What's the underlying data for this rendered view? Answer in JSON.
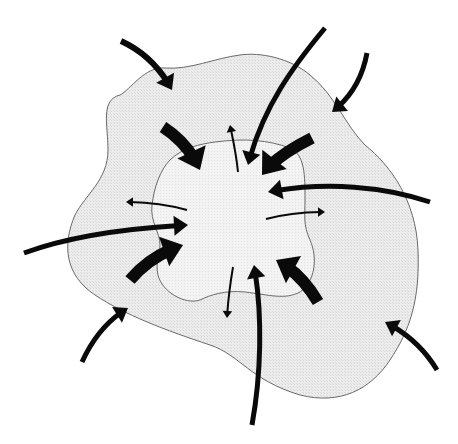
{
  "diagram": {
    "width": 458,
    "height": 444,
    "colors": {
      "background": "#ffffff",
      "outer_fill": "#ececec",
      "inner_fill": "#f4f4f4",
      "outline": "#6a6a6a",
      "arrow": "#0a0a0a"
    },
    "regions": [
      {
        "id": "outer-region",
        "path": "M120,95 C100,100 108,125 108,150 C108,180 85,195 75,215 C62,245 65,275 95,295 C125,315 165,330 210,345 C240,355 250,380 300,395 C340,405 370,390 390,360 C410,330 420,300 418,250 C416,200 390,165 365,145 C345,125 335,95 310,75 C290,58 260,52 240,55 C215,58 190,70 165,68 C145,66 130,90 120,95 Z"
      },
      {
        "id": "inner-region",
        "path": "M215,142 C245,138 268,140 290,148 C305,155 305,175 305,200 C305,215 303,225 310,240 C318,258 315,282 300,292 C285,300 270,295 245,292 C225,290 210,295 200,300 C185,305 162,292 158,275 C155,262 160,255 160,245 C160,232 150,222 152,205 C154,188 160,170 170,160 C182,148 200,144 215,142 Z"
      }
    ],
    "inward_arrows": [
      {
        "id": "arrow-top-left-outer",
        "path": "M121,41 C145,52 160,68 172,90",
        "width": 6,
        "head": 14
      },
      {
        "id": "arrow-top-center-long",
        "path": "M325,28 C290,70 262,110 248,165",
        "width": 5,
        "head": 13
      },
      {
        "id": "arrow-top-right-outer",
        "path": "M367,53 C362,80 350,98 332,112",
        "width": 5,
        "head": 13
      },
      {
        "id": "arrow-upper-left-thick",
        "path": "M163,127 C180,138 192,152 200,170",
        "width": 12,
        "head": 20
      },
      {
        "id": "arrow-upper-right-thick",
        "path": "M312,138 C292,148 275,158 262,175",
        "width": 12,
        "head": 20
      },
      {
        "id": "arrow-right-long",
        "path": "M430,202 C380,185 320,182 268,192",
        "width": 5,
        "head": 14
      },
      {
        "id": "arrow-left-long",
        "path": "M24,253 C70,236 130,228 188,225",
        "width": 5,
        "head": 14
      },
      {
        "id": "arrow-lower-left-thick",
        "path": "M130,280 C145,262 162,252 183,245",
        "width": 12,
        "head": 20
      },
      {
        "id": "arrow-lower-right-thick",
        "path": "M318,302 C308,285 295,270 276,260",
        "width": 12,
        "head": 20
      },
      {
        "id": "arrow-bottom-center-long",
        "path": "M252,425 C262,370 262,310 254,265",
        "width": 5,
        "head": 13
      },
      {
        "id": "arrow-bottom-left-outer",
        "path": "M82,362 C92,340 105,322 128,308",
        "width": 5,
        "head": 13
      },
      {
        "id": "arrow-bottom-right-outer",
        "path": "M437,370 C425,350 410,335 385,322",
        "width": 5,
        "head": 13
      }
    ],
    "outward_arrows": [
      {
        "id": "arrow-out-top",
        "path": "M238,172 C236,152 233,140 230,125",
        "width": 2,
        "head": 7
      },
      {
        "id": "arrow-out-left",
        "path": "M187,210 C165,204 145,202 126,202",
        "width": 2,
        "head": 7
      },
      {
        "id": "arrow-out-right",
        "path": "M266,219 C285,214 305,212 325,212",
        "width": 2,
        "head": 7
      },
      {
        "id": "arrow-out-bottom",
        "path": "M233,267 C230,285 228,300 227,318",
        "width": 2,
        "head": 7
      }
    ]
  }
}
